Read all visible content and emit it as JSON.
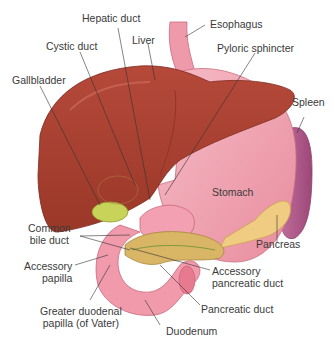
{
  "labels": {
    "hepatic_duct": "Hepatic duct",
    "esophagus": "Esophagus",
    "cystic_duct": "Cystic duct",
    "liver": "Liver",
    "pyloric_sphincter": "Pyloric sphincter",
    "gallbladder": "Gallbladder",
    "spleen": "Spleen",
    "stomach": "Stomach",
    "common_bile_duct_1": "Common",
    "common_bile_duct_2": "bile duct",
    "pancreas": "Pancreas",
    "accessory_papilla_1": "Accessory",
    "accessory_papilla_2": "papilla",
    "accessory_pancreatic_duct_1": "Accessory",
    "accessory_pancreatic_duct_2": "pancreatic duct",
    "greater_duodenal_papilla_1": "Greater duodenal",
    "greater_duodenal_papilla_2": "papilla (of Vater)",
    "pancreatic_duct": "Pancreatic duct",
    "duodenum": "Duodenum"
  },
  "colors": {
    "liver": "#a8402f",
    "liver_dark": "#7e2a1e",
    "stomach": "#f2a7b4",
    "stomach_dark": "#d97a8c",
    "esophagus": "#ef9aaa",
    "spleen": "#b05a8a",
    "pancreas": "#f0cc82",
    "pancreas_dark": "#c9a24f",
    "gallbladder": "#c8d35a",
    "duodenum": "#f09aac",
    "leader_line": "#333333",
    "text": "#3a3a3a"
  }
}
